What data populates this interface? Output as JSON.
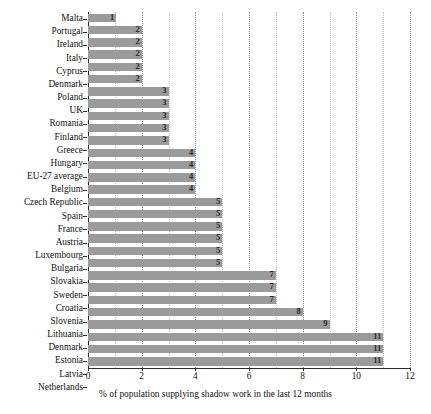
{
  "chart_data": {
    "type": "bar",
    "orientation": "horizontal",
    "title": "",
    "xlabel": "% of population supplying shadow work in the last 12 months",
    "ylabel": "",
    "xlim": [
      0,
      12
    ],
    "xticks": [
      0,
      2,
      4,
      6,
      8,
      10,
      12
    ],
    "xticklabels": [
      "0",
      "2",
      "4",
      "6",
      "8",
      "10",
      "12"
    ],
    "minor_xticks": [
      1,
      3,
      5,
      7,
      9,
      11
    ],
    "grid": "vertical dotted gridlines at major and minor x ticks",
    "legend": "none",
    "bar_color": "#9b9b9b",
    "value_label_position": "inside bar end, right aligned",
    "categories": [
      "Malta",
      "Portugal",
      "Ireland",
      "Italy",
      "Cyprus",
      "Denmark",
      "Poland",
      "UK",
      "Romania",
      "Finland",
      "Greece",
      "Hungary",
      "EU-27 average",
      "Belgium",
      "Czech Republic",
      "Spain",
      "France",
      "Austria",
      "Luxembourg",
      "Bulgaria",
      "Slovakia",
      "Sweden",
      "Croatia",
      "Slovenia",
      "Lithuania",
      "Denmark",
      "Estonia",
      "Latvia",
      "Netherlands"
    ],
    "values": [
      1,
      2,
      2,
      2,
      2,
      2,
      3,
      3,
      3,
      3,
      3,
      4,
      4,
      4,
      4,
      5,
      5,
      5,
      5,
      5,
      5,
      7,
      7,
      7,
      8,
      9,
      11,
      11,
      11
    ],
    "value_labels": [
      "1",
      "2",
      "2",
      "2",
      "2",
      "2",
      "3",
      "3",
      "3",
      "3",
      "3",
      "4",
      "4",
      "4",
      "4",
      "5",
      "5",
      "5",
      "5",
      "5",
      "5",
      "7",
      "7",
      "7",
      "8",
      "9",
      "11",
      "11",
      "11"
    ]
  },
  "colors": {
    "bar": "#9b9b9b",
    "axis": "#2b2b2b",
    "gridline_major": "#8f8f8f",
    "gridline_minor": "#c4c4c4",
    "text": "#121212"
  }
}
